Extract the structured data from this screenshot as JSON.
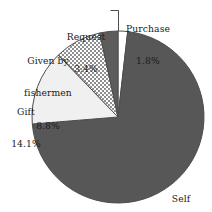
{
  "chart_data": {
    "type": "pie",
    "title": "",
    "subtitle": "",
    "xlabel": "",
    "ylabel": "",
    "legend_position": "none",
    "grid": false,
    "labels_inline": true,
    "start_angle_deg": -90,
    "direction": "clockwise",
    "categories": [
      "Purchase",
      "Self acquired",
      "Gift",
      "Given by fishermen",
      "Request"
    ],
    "values": [
      1.8,
      71.9,
      14.1,
      8.8,
      3.4
    ],
    "units": "%",
    "slices": [
      {
        "name": "Purchase",
        "label": "Purchase",
        "value": 1.8,
        "value_text": "1.8%",
        "fill": "#ffffff",
        "pattern": "solid",
        "stroke": "#4d4d4d",
        "start_deg": -90.0,
        "end_deg": -83.52,
        "has_leader_line": true
      },
      {
        "name": "Self acquired",
        "label_line1": "Self",
        "label_line2": "acquired",
        "value": 71.9,
        "value_text": "71.9%",
        "fill": "#575757",
        "pattern": "solid",
        "stroke": "#4d4d4d",
        "start_deg": -83.52,
        "end_deg": 175.32,
        "has_leader_line": false
      },
      {
        "name": "Gift",
        "label": "Gift",
        "value": 14.1,
        "value_text": "14.1%",
        "fill": "#f0f0f0",
        "pattern": "solid",
        "stroke": "#4d4d4d",
        "start_deg": 175.32,
        "end_deg": 226.08,
        "has_leader_line": false
      },
      {
        "name": "Given by fishermen",
        "label_line1": "Given by",
        "label_line2": "fishermen",
        "value": 8.8,
        "value_text": "8.8%",
        "fill": "#ffffff",
        "pattern": "checkered-dots",
        "stroke": "#4d4d4d",
        "start_deg": 226.08,
        "end_deg": 257.76,
        "has_leader_line": false
      },
      {
        "name": "Request",
        "label": "Request",
        "value": 3.4,
        "value_text": "3.4%",
        "fill": "#5c5c5c",
        "pattern": "solid",
        "stroke": "#4d4d4d",
        "start_deg": 257.76,
        "end_deg": 270.0,
        "has_leader_line": false
      }
    ],
    "geometry": {
      "center_x": 118,
      "center_y": 117,
      "radius": 86
    },
    "colors": {
      "dark_gray": "#575757",
      "light_gray": "#f0f0f0",
      "white": "#ffffff",
      "outline": "#4d4d4d",
      "text": "#1a1a1a"
    }
  },
  "labels": {
    "purchase": {
      "name": "Purchase",
      "value": "1.8%"
    },
    "request": {
      "name": "Request",
      "value": "3.4%"
    },
    "fishermen": {
      "name_line1": "Given by",
      "name_line2": "fishermen",
      "value": "8.8%"
    },
    "gift": {
      "name": "Gift",
      "value": "14.1%"
    },
    "self_acquired": {
      "name_line1": "Self",
      "name_line2": "acquired",
      "value": "71.9%"
    }
  }
}
